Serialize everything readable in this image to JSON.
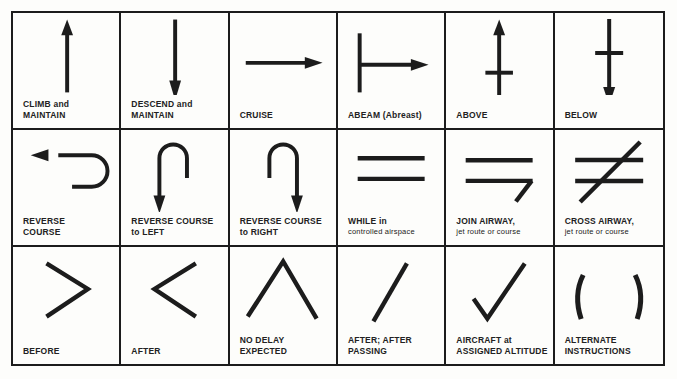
{
  "symbols": [
    {
      "name": "climb-and-maintain",
      "icon": "up-arrow-icon",
      "line1": "CLIMB and",
      "line2": "MAINTAIN"
    },
    {
      "name": "descend-and-maintain",
      "icon": "down-arrow-icon",
      "line1": "DESCEND and",
      "line2": "MAINTAIN"
    },
    {
      "name": "cruise",
      "icon": "right-arrow-icon",
      "line1": "CRUISE",
      "line2": ""
    },
    {
      "name": "abeam",
      "icon": "abeam-icon",
      "line1": "ABEAM (Abreast)",
      "line2": ""
    },
    {
      "name": "above",
      "icon": "above-icon",
      "line1": "ABOVE",
      "line2": ""
    },
    {
      "name": "below",
      "icon": "below-icon",
      "line1": "BELOW",
      "line2": ""
    },
    {
      "name": "reverse-course",
      "icon": "reverse-course-icon",
      "line1": "REVERSE",
      "line2": "COURSE"
    },
    {
      "name": "reverse-course-left",
      "icon": "reverse-left-icon",
      "line1": "REVERSE COURSE",
      "line2": "to LEFT"
    },
    {
      "name": "reverse-course-right",
      "icon": "reverse-right-icon",
      "line1": "REVERSE COURSE",
      "line2": "to RIGHT"
    },
    {
      "name": "while-in",
      "icon": "equals-icon",
      "line1": "WHILE in",
      "line2": "controlled airspace"
    },
    {
      "name": "join-airway",
      "icon": "join-airway-icon",
      "line1": "JOIN AIRWAY,",
      "line2": "jet route or course"
    },
    {
      "name": "cross-airway",
      "icon": "not-equal-icon",
      "line1": "CROSS AIRWAY,",
      "line2": "jet route or course"
    },
    {
      "name": "before",
      "icon": "greater-than-icon",
      "line1": "BEFORE",
      "line2": ""
    },
    {
      "name": "after",
      "icon": "less-than-icon",
      "line1": "AFTER",
      "line2": ""
    },
    {
      "name": "no-delay-expected",
      "icon": "caret-icon",
      "line1": "NO DELAY",
      "line2": "EXPECTED"
    },
    {
      "name": "after-passing",
      "icon": "slash-icon",
      "line1": "AFTER; AFTER",
      "line2": "PASSING"
    },
    {
      "name": "aircraft-at-assigned-altitude",
      "icon": "checkmark-icon",
      "line1": "AIRCRAFT at",
      "line2": "ASSIGNED ALTITUDE"
    },
    {
      "name": "alternate-instructions",
      "icon": "parentheses-icon",
      "line1": "ALTERNATE",
      "line2": "INSTRUCTIONS"
    }
  ],
  "colors": {
    "ink": "#1c1c1c",
    "paper": "#fdfdfb"
  }
}
